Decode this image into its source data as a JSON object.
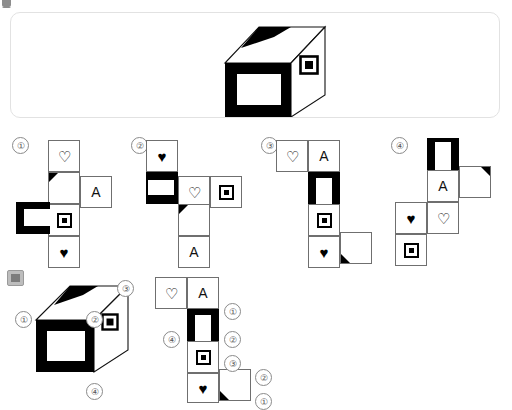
{
  "page": {
    "top_badge": "partial-ui-fragment"
  },
  "question": {
    "panel_label": "question-cube-panel",
    "cube": {
      "front_face": "black-frame-with-white-rectangle",
      "right_face": "bordered-square",
      "top_face": "black-corner-triangle"
    }
  },
  "options": [
    {
      "id": 1,
      "number": "①",
      "cells": [
        {
          "name": "heart-outline-cell",
          "glyph": "♡"
        },
        {
          "name": "triangle-corner-cell",
          "glyph": "corner-triangle-top-left"
        },
        {
          "name": "letter-a-cell",
          "glyph": "A"
        },
        {
          "name": "c-shape-cell",
          "glyph": "black-c-shape"
        },
        {
          "name": "bordered-square-cell",
          "glyph": "square-in-square"
        },
        {
          "name": "heart-filled-cell",
          "glyph": "♥"
        }
      ]
    },
    {
      "id": 2,
      "number": "②",
      "cells": [
        {
          "name": "heart-filled-cell",
          "glyph": "♥"
        },
        {
          "name": "c-shape-cell",
          "glyph": "black-c-shape"
        },
        {
          "name": "heart-outline-cell",
          "glyph": "♡"
        },
        {
          "name": "bordered-square-cell",
          "glyph": "square-in-square"
        },
        {
          "name": "triangle-corner-cell",
          "glyph": "corner-triangle-top-left"
        },
        {
          "name": "letter-a-cell",
          "glyph": "A"
        }
      ]
    },
    {
      "id": 3,
      "number": "③",
      "cells": [
        {
          "name": "heart-outline-cell",
          "glyph": "♡"
        },
        {
          "name": "letter-a-cell",
          "glyph": "A"
        },
        {
          "name": "u-shape-cell",
          "glyph": "black-u-shape"
        },
        {
          "name": "bordered-square-cell",
          "glyph": "square-in-square"
        },
        {
          "name": "heart-filled-cell",
          "glyph": "♥"
        },
        {
          "name": "triangle-corner-cell",
          "glyph": "corner-triangle-bottom-left"
        }
      ]
    },
    {
      "id": 4,
      "number": "④",
      "cells": [
        {
          "name": "u-shape-cell",
          "glyph": "black-u-shape"
        },
        {
          "name": "letter-a-cell",
          "glyph": "A"
        },
        {
          "name": "triangle-corner-cell",
          "glyph": "corner-triangle-top-right"
        },
        {
          "name": "heart-filled-cell",
          "glyph": "♥"
        },
        {
          "name": "heart-outline-cell",
          "glyph": "♡"
        },
        {
          "name": "bordered-square-cell",
          "glyph": "square-in-square"
        }
      ]
    }
  ],
  "solution": {
    "cube": {
      "vertex_labels": [
        "①",
        "②",
        "③",
        "④"
      ],
      "front_face": "black-frame-with-white-rectangle",
      "right_face": "bordered-square",
      "top_face": "black-corner-triangle"
    },
    "net": {
      "edge_labels": [
        "①",
        "②",
        "③",
        "④",
        "②",
        "①"
      ],
      "cells": [
        {
          "name": "heart-outline-cell",
          "glyph": "♡"
        },
        {
          "name": "letter-a-cell",
          "glyph": "A"
        },
        {
          "name": "u-shape-cell",
          "glyph": "black-u-shape"
        },
        {
          "name": "bordered-square-cell",
          "glyph": "square-in-square"
        },
        {
          "name": "heart-filled-cell",
          "glyph": "♥"
        },
        {
          "name": "triangle-corner-cell",
          "glyph": "corner-triangle-bottom-left"
        }
      ]
    }
  },
  "colors": {
    "ink": "#000000",
    "cell_border": "#6f6f6f",
    "panel_border": "#e2e2e2",
    "number_circle": "#8a8a8a",
    "background": "#ffffff"
  }
}
